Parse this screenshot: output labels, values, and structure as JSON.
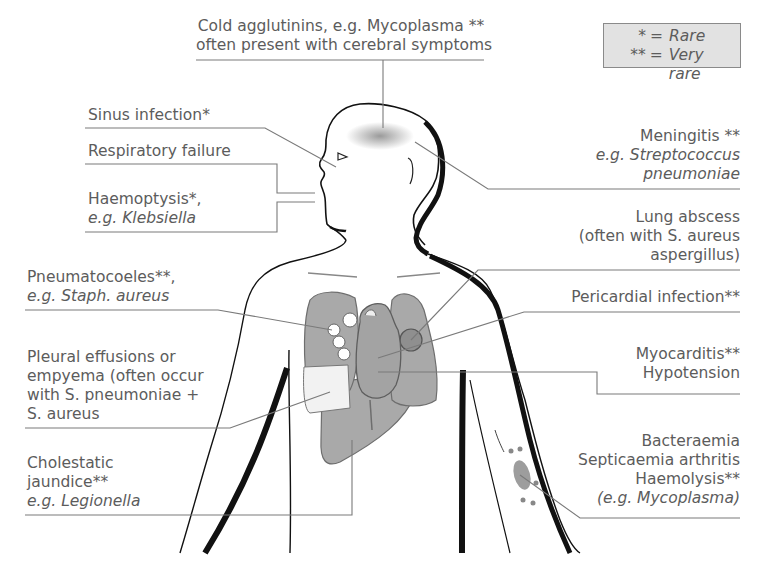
{
  "legend": {
    "rows": [
      {
        "symbol": "*",
        "eq": "=",
        "meaning": "Rare"
      },
      {
        "symbol": "**",
        "eq": "=",
        "meaning": "Very rare"
      }
    ]
  },
  "labels": {
    "cold_agglutinins": {
      "line1": "Cold agglutinins, e.g. Mycoplasma **",
      "line2": "often present with cerebral symptoms"
    },
    "sinus": {
      "line1": "Sinus infection*"
    },
    "respiratory": {
      "line1": "Respiratory failure"
    },
    "haemoptysis": {
      "line1": "Haemoptysis*,",
      "line2": "e.g. Klebsiella"
    },
    "pneumatocoeles": {
      "line1": "Pneumatocoeles**,",
      "line2": "e.g. Staph. aureus"
    },
    "pleural": {
      "line1": "Pleural effusions or",
      "line2": "empyema (often occur",
      "line3": "with S. pneumoniae +",
      "line4": "S. aureus"
    },
    "cholestatic": {
      "line1": "Cholestatic",
      "line2": "jaundice**",
      "line3": "e.g. Legionella"
    },
    "meningitis": {
      "line1": "Meningitis **",
      "line2": "e.g. Streptococcus",
      "line3": "pneumoniae"
    },
    "lung_abscess": {
      "line1": "Lung abscess",
      "line2": "(often with S. aureus",
      "line3": "aspergillus)"
    },
    "pericardial": {
      "line1": "Pericardial infection**"
    },
    "myocarditis": {
      "line1": "Myocarditis**",
      "line2": "Hypotension"
    },
    "bacteraemia": {
      "line1": "Bacteraemia",
      "line2": "Septicaemia arthritis",
      "line3": "Haemolysis**",
      "line4": "(e.g. Mycoplasma)"
    }
  },
  "colors": {
    "organ_fill": "#a9a9a9",
    "organ_stroke": "#6e6e6e",
    "line": "#7a7a7a",
    "outline": "#111111",
    "legend_bg": "#e2e2e2",
    "text": "#5c5c5c"
  }
}
